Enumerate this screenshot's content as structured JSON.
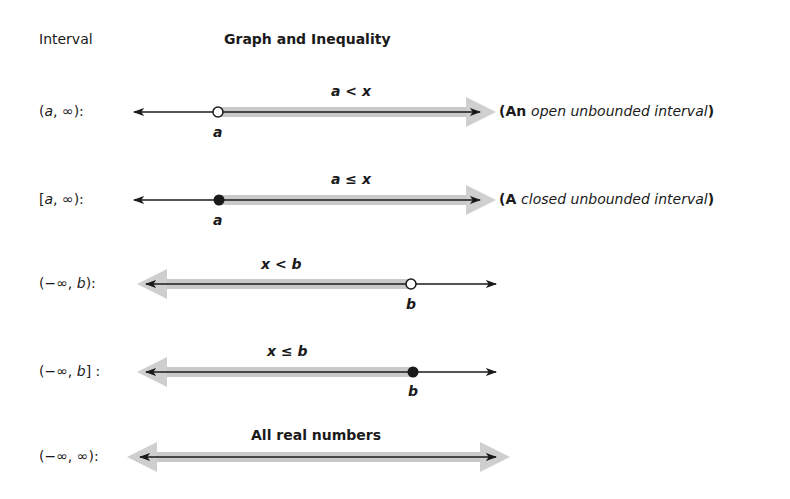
{
  "header": {
    "interval_col": "Interval",
    "graph_col": "Graph and Inequality"
  },
  "rows": [
    {
      "interval_open": "(",
      "interval_var": "a",
      "interval_rest": ", ∞):",
      "inequality": "a < x",
      "endpoint_label": "a",
      "endpoint_type": "open",
      "shade_direction": "right",
      "note_prefix": "(An ",
      "note_italic": "open unbounded interval",
      "note_suffix": ")"
    },
    {
      "interval_open": "[",
      "interval_var": "a",
      "interval_rest": ", ∞):",
      "inequality": "a ≤ x",
      "endpoint_label": "a",
      "endpoint_type": "closed",
      "shade_direction": "right",
      "note_prefix": "(A ",
      "note_italic": "closed unbounded interval",
      "note_suffix": ")"
    },
    {
      "interval_open": "(−∞, ",
      "interval_var": "b",
      "interval_rest": "):",
      "inequality": "x < b",
      "endpoint_label": "b",
      "endpoint_type": "open",
      "shade_direction": "left"
    },
    {
      "interval_open": "(−∞, ",
      "interval_var": "b",
      "interval_rest": "] :",
      "inequality": "x ≤ b",
      "endpoint_label": "b",
      "endpoint_type": "closed",
      "shade_direction": "left"
    },
    {
      "interval_open": "(−∞, ∞):",
      "interval_var": "",
      "interval_rest": "",
      "inequality": "All real numbers",
      "endpoint_label": "",
      "endpoint_type": "none",
      "shade_direction": "both"
    }
  ],
  "colors": {
    "line": "#1a1a1a",
    "shade": "#c9c9c9",
    "background": "#ffffff"
  }
}
